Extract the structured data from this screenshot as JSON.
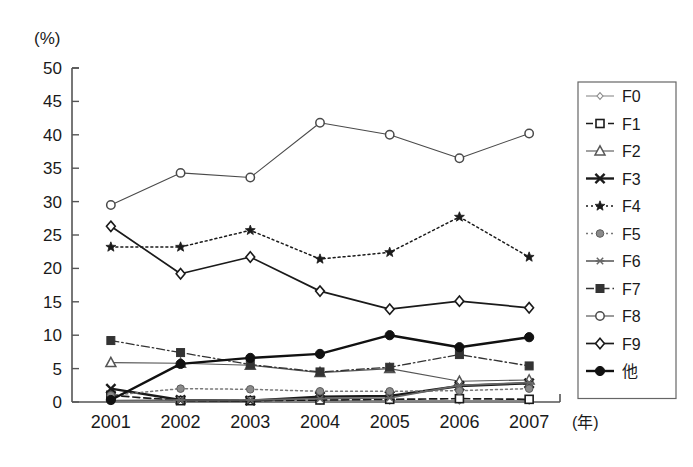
{
  "chart_data": {
    "type": "line",
    "title": "",
    "xlabel": "(年)",
    "ylabel": "(%)",
    "categories": [
      "2001",
      "2002",
      "2003",
      "2004",
      "2005",
      "2006",
      "2007"
    ],
    "x": [
      2001,
      2002,
      2003,
      2004,
      2005,
      2006,
      2007
    ],
    "ylim": [
      0,
      50
    ],
    "yticks": [
      0,
      5,
      10,
      15,
      20,
      25,
      30,
      35,
      40,
      45,
      50
    ],
    "ytick_labels": [
      "0",
      "5",
      "10",
      "15",
      "20",
      "25",
      "30",
      "35",
      "40",
      "45",
      "50"
    ],
    "grid": false,
    "legend_position": "right",
    "series": [
      {
        "name": "F0",
        "marker": "diamond-open-small",
        "line": "solid-thin",
        "color": "#8a8a8a",
        "values": [
          0.2,
          0.2,
          0.2,
          0.2,
          0.2,
          0.2,
          0.2
        ]
      },
      {
        "name": "F1",
        "marker": "square-open",
        "line": "dashed",
        "color": "#1a1a1a",
        "values": [
          1.0,
          0.2,
          0.2,
          0.3,
          0.4,
          0.5,
          0.4
        ]
      },
      {
        "name": "F2",
        "marker": "triangle-open",
        "line": "solid-thin",
        "color": "#555555",
        "values": [
          5.9,
          5.8,
          5.5,
          4.4,
          5.0,
          3.1,
          3.3
        ]
      },
      {
        "name": "F3",
        "marker": "x-bold",
        "line": "solid-bold",
        "color": "#1a1a1a",
        "values": [
          2.0,
          0.3,
          0.2,
          0.8,
          0.9,
          2.4,
          2.8
        ]
      },
      {
        "name": "F4",
        "marker": "star",
        "line": "dotted",
        "color": "#1a1a1a",
        "values": [
          23.2,
          23.2,
          25.7,
          21.4,
          22.4,
          27.7,
          21.7
        ]
      },
      {
        "name": "F5",
        "marker": "circle-filled-gray",
        "line": "dotted",
        "color": "#777777",
        "values": [
          1.0,
          2.0,
          1.9,
          1.6,
          1.6,
          1.7,
          2.0
        ]
      },
      {
        "name": "F6",
        "marker": "asterisk",
        "line": "solid",
        "color": "#666666",
        "values": [
          0.2,
          0.3,
          0.3,
          0.5,
          0.6,
          2.5,
          2.9
        ]
      },
      {
        "name": "F7",
        "marker": "square-filled",
        "line": "dash-dot",
        "color": "#333333",
        "values": [
          9.2,
          7.4,
          5.6,
          4.5,
          5.2,
          7.1,
          5.4
        ]
      },
      {
        "name": "F8",
        "marker": "circle-open",
        "line": "solid-thin",
        "color": "#4a4a4a",
        "values": [
          29.5,
          34.3,
          33.6,
          41.8,
          40.0,
          36.5,
          40.2
        ]
      },
      {
        "name": "F9",
        "marker": "diamond-open",
        "line": "solid",
        "color": "#1a1a1a",
        "values": [
          26.3,
          19.2,
          21.7,
          16.6,
          13.9,
          15.1,
          14.1
        ]
      },
      {
        "name": "他",
        "marker": "circle-filled",
        "line": "solid-bold",
        "color": "#111111",
        "values": [
          0.3,
          5.7,
          6.6,
          7.2,
          10.0,
          8.2,
          9.7
        ]
      }
    ]
  },
  "legend": {
    "entries": [
      "F0",
      "F1",
      "F2",
      "F3",
      "F4",
      "F5",
      "F6",
      "F7",
      "F8",
      "F9",
      "他"
    ]
  }
}
